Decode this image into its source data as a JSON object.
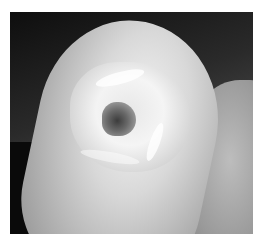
{
  "image": {
    "description": "Grayscale clinical photograph of a fingertip with a central dark lesion on the nail area, adjacent finger at right, dark background",
    "border_color": "#ffffff",
    "palette": {
      "background_dark": "#0e0e0e",
      "skin_light": "#e6e6e6",
      "skin_mid": "#b4b4b4",
      "lesion_dark": "#3c3c3c"
    }
  }
}
